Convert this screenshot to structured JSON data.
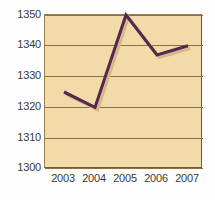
{
  "chart_data": {
    "type": "line",
    "title": "",
    "subtitle": "",
    "xlabel": "",
    "ylabel": "",
    "categories": [
      "2003",
      "2004",
      "2005",
      "2006",
      "2007"
    ],
    "values": [
      1325,
      1320,
      1350,
      1337,
      1340
    ],
    "series": [
      {
        "name": "series-1",
        "values": [
          1325,
          1320,
          1350,
          1337,
          1340
        ],
        "color": "#57284f"
      }
    ],
    "ylim": [
      1300,
      1350
    ],
    "yticks": [
      1300,
      1310,
      1320,
      1330,
      1340,
      1350
    ],
    "ytick_labels": [
      "1300",
      "1310",
      "1320",
      "1330",
      "1340",
      "1350"
    ],
    "xtick_labels": [
      "2003",
      "2004",
      "2005",
      "2006",
      "2007"
    ],
    "grid": true,
    "grid_axis": "y",
    "legend": false,
    "legend_position": "none",
    "annotations": []
  },
  "style": {
    "plot_background": "#f3daa9",
    "page_background": "#fefefe",
    "gridline_color": "#8a7043",
    "border_color": "#6e5a39",
    "line_color": "#57284f",
    "shadow_line_color": "#d9b887",
    "tick_label_color": "#3a3a3a"
  }
}
